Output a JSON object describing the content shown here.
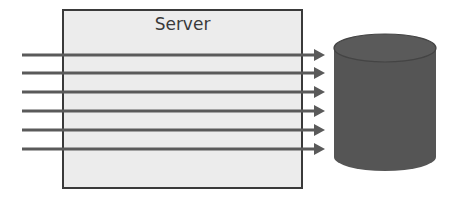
{
  "diagram": {
    "server": {
      "label": "Server"
    },
    "database": {
      "icon": "database-cylinder-icon"
    },
    "arrows": {
      "count": 6,
      "y": [
        55,
        73,
        92,
        111,
        130,
        149
      ],
      "x_start": 22,
      "x_end": 325
    },
    "colors": {
      "box_fill": "#ececec",
      "box_border": "#3a3a3a",
      "arrow": "#5a5a5a",
      "cylinder": "#555555",
      "cylinder_edge": "#444444"
    }
  }
}
